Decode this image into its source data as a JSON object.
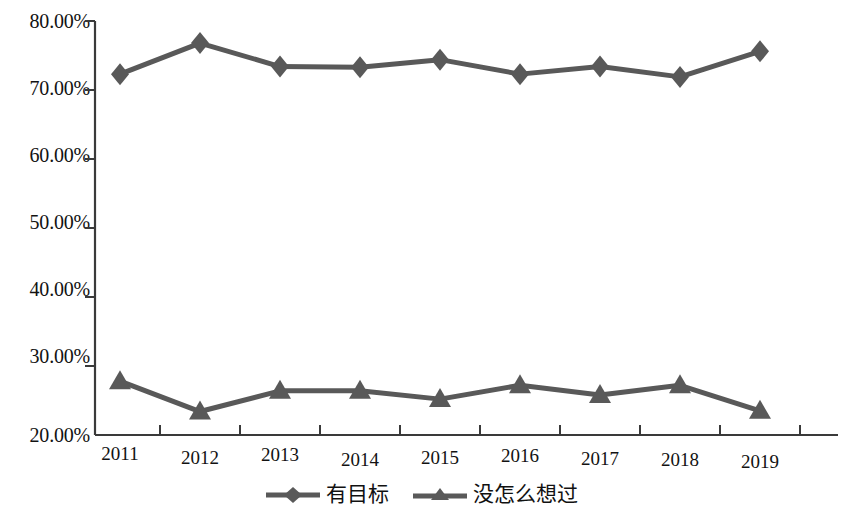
{
  "chart_data": {
    "type": "line",
    "title": "",
    "subtitle": "",
    "xlabel": "",
    "ylabel": "",
    "categories": [
      "2011",
      "2012",
      "2013",
      "2014",
      "2015",
      "2016",
      "2017",
      "2018",
      "2019"
    ],
    "ylim": [
      20,
      80
    ],
    "ytick_values": [
      20,
      30,
      40,
      50,
      60,
      70,
      80
    ],
    "ytick_labels": [
      "20.00%",
      "30.00%",
      "40.00%",
      "50.00%",
      "60.00%",
      "70.00%",
      "80.00%"
    ],
    "grid": false,
    "legend_position": "bottom",
    "series": [
      {
        "name": "有目标",
        "marker": "diamond",
        "color": "#595959",
        "values": [
          72.3,
          76.8,
          73.4,
          73.3,
          74.4,
          72.3,
          73.4,
          71.9,
          75.6
        ]
      },
      {
        "name": "没怎么想过",
        "marker": "triangle",
        "color": "#595959",
        "values": [
          27.8,
          23.4,
          26.4,
          26.4,
          25.2,
          27.2,
          25.8,
          27.2,
          23.5
        ]
      }
    ]
  },
  "legend": {
    "items": [
      {
        "label": "有目标",
        "marker": "diamond"
      },
      {
        "label": "没怎么想过",
        "marker": "triangle"
      }
    ]
  },
  "axes": {
    "y_axis_name": "percentage-axis",
    "x_axis_name": "year-axis"
  },
  "colors": {
    "series_line": "#595959",
    "axis": "#3a3a3a",
    "text": "#121212",
    "background": "#ffffff"
  }
}
